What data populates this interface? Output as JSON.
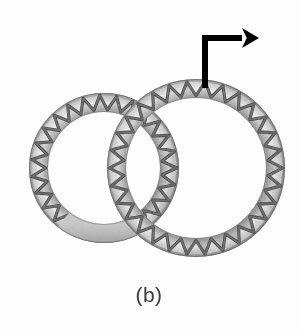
{
  "figure": {
    "caption": "(b)",
    "background_color": "#fdfdfd",
    "width": 298,
    "height": 334,
    "colors": {
      "background": "#fdfdfd",
      "band_light": "#d8d8d8",
      "band_mid": "#b4b4b4",
      "band_dark": "#8f8f8f",
      "band_edge": "#707070",
      "zigzag_line": "#3a3a3a",
      "blur_patch": "#b9b9b9",
      "arrow": "#000000",
      "caption_text": "#3b3b3b"
    },
    "rings": [
      {
        "id": "left-ring",
        "cx": 104,
        "cy": 168,
        "outer_r": 75,
        "band_thickness": 19,
        "zigzag_count": 27,
        "defocus_arc_start_deg": 55,
        "defocus_arc_end_deg": 128,
        "z": 1
      },
      {
        "id": "right-ring",
        "cx": 196,
        "cy": 168,
        "outer_r": 89,
        "band_thickness": 19,
        "zigzag_count": 30,
        "defocus_arc_start_deg": 0,
        "defocus_arc_end_deg": 0,
        "z": 2
      }
    ],
    "arrow": {
      "id": "flow-arrow",
      "stem_x": 205,
      "stem_bottom_y": 88,
      "stem_top_y": 38,
      "head_x": 259,
      "head_y": 38,
      "stroke_width": 6,
      "head_length": 17,
      "head_half_width": 10,
      "color": "#000000",
      "direction": "up-then-right"
    }
  }
}
